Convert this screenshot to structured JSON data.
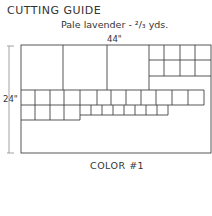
{
  "guide": {
    "title": "CUTTING GUIDE",
    "subtitle": "Pale lavender - ²/₃ yds.",
    "width_label": "44\"",
    "height_label": "24\"",
    "color_label": "COLOR #1"
  }
}
